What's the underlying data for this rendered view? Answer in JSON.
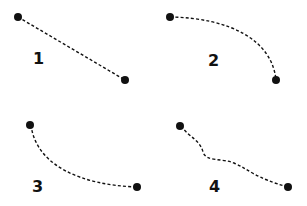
{
  "diagram": {
    "colors": {
      "stroke": "#111111",
      "background": "#ffffff"
    },
    "panels": [
      {
        "label": "1",
        "style": "straight",
        "start": [
          18,
          17
        ],
        "end": [
          125,
          80
        ],
        "label_pos": [
          37,
          64
        ]
      },
      {
        "label": "2",
        "style": "curved-arc",
        "start": [
          170,
          17
        ],
        "end": [
          276,
          80
        ],
        "label_pos": [
          213,
          66
        ]
      },
      {
        "label": "3",
        "style": "curved-arc-reverse",
        "start": [
          30,
          125
        ],
        "end": [
          137,
          187
        ],
        "label_pos": [
          36,
          192
        ]
      },
      {
        "label": "4",
        "style": "wavy",
        "start": [
          180,
          126
        ],
        "end": [
          288,
          187
        ],
        "label_pos": [
          213,
          192
        ]
      }
    ]
  }
}
